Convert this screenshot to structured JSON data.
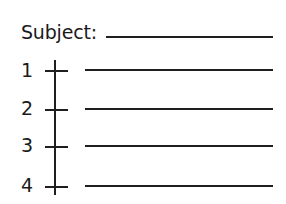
{
  "form": {
    "subject_label": "Subject:",
    "subject_value": "",
    "rows": [
      {
        "number": "1",
        "value": ""
      },
      {
        "number": "2",
        "value": ""
      },
      {
        "number": "3",
        "value": ""
      },
      {
        "number": "4",
        "value": ""
      }
    ]
  }
}
